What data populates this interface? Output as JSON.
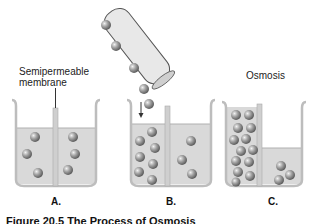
{
  "figure": {
    "labels": {
      "membrane": "Semipermeable\nmembrane",
      "osmosis": "Osmosis"
    },
    "panels": [
      "A.",
      "B.",
      "C."
    ],
    "caption": "Figure 20.5 The Process of Osmosis",
    "colors": {
      "water": "#d6d6d6",
      "beaker": "#c4c4c4",
      "particle": "#8a8a8a",
      "tube": "#e4e4e4"
    },
    "particle_counts": {
      "A": {
        "left": 3,
        "right": 3
      },
      "B": {
        "left": 7,
        "right": 3,
        "falling": 2,
        "in_tube": 3
      },
      "C": {
        "left": 13,
        "right": 3
      }
    }
  }
}
